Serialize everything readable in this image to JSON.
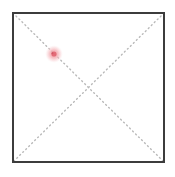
{
  "canvas": {
    "width": 175,
    "height": 177,
    "background_color": "#ffffff",
    "label": "drawing-canvas"
  },
  "shapes": {
    "square": {
      "name": "square-outline",
      "stroke_color": "#3c3c3c",
      "stroke_width": 2,
      "fill": "none",
      "x": 13,
      "y": 13,
      "width": 151,
      "height": 149,
      "corners": {
        "top_left": [
          13,
          13
        ],
        "top_right": [
          164,
          13
        ],
        "bottom_right": [
          164,
          162
        ],
        "bottom_left": [
          13,
          162
        ]
      }
    },
    "diagonals": [
      {
        "name": "diagonal-top-left-to-bottom-right",
        "from": [
          13,
          13
        ],
        "to": [
          164,
          162
        ],
        "stroke_color": "#b9b9b9",
        "stroke_width": 1.4,
        "dash_pattern": "1,3.2"
      },
      {
        "name": "diagonal-top-right-to-bottom-left",
        "from": [
          164,
          13
        ],
        "to": [
          13,
          162
        ],
        "stroke_color": "#b9b9b9",
        "stroke_width": 1.4,
        "dash_pattern": "1,3.2"
      }
    ],
    "intersection_point": {
      "name": "diagonal-intersection",
      "x": 88,
      "y": 88
    }
  },
  "marker": {
    "name": "pink-cursor-marker",
    "x": 54,
    "y": 54,
    "glow_radius": 9,
    "core_radius": 2.6,
    "glow_color": "#f4a9ae",
    "core_color": "#e0606d",
    "on_diagonal": "diagonal-top-left-to-bottom-right"
  }
}
